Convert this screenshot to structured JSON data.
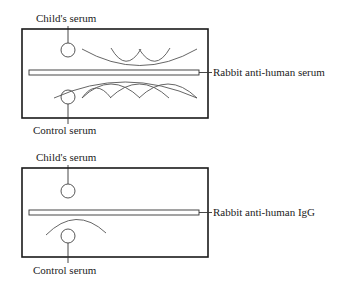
{
  "panels": [
    {
      "id": "top",
      "top_label": "Child's serum",
      "bottom_label": "Control serum",
      "trough_label": "Rabbit anti-human serum",
      "description": "Multiple precipitin arcs on both child's and control serum sides"
    },
    {
      "id": "bottom",
      "top_label": "Child's serum",
      "bottom_label": "Control serum",
      "trough_label": "Rabbit anti-human IgG",
      "description": "No precipitin arc for child's serum; single arc for control serum"
    }
  ],
  "colors": {
    "line": "#1a1a1a",
    "arc": "#555555",
    "background": "#ffffff"
  }
}
